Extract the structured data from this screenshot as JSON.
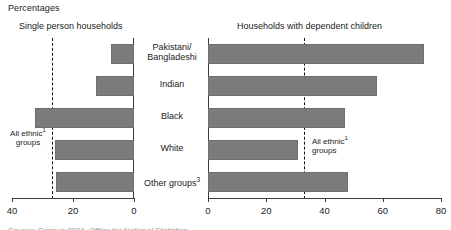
{
  "units_label": "Percentages",
  "panels": {
    "left": {
      "title": "Single person households"
    },
    "right": {
      "title": "Households with dependent children"
    }
  },
  "annotations": {
    "left_ref_line_1": "All ethnic",
    "left_ref_line_1_sup": "1",
    "left_ref_line_2": "groups",
    "right_ref_line_1": "All ethnic",
    "right_ref_line_1_sup": "1",
    "right_ref_line_2": "groups"
  },
  "footnote_strip": "Source: Census 2001, Office for National Statistics",
  "chart_data": {
    "type": "bar",
    "title": "Percentages",
    "orientation": "horizontal",
    "layout": "back-to-back paired panels",
    "categories": [
      "Pakistani/ Bangladeshi",
      "Indian",
      "Black",
      "White",
      "Other groups"
    ],
    "category_labels_display": [
      {
        "line1": "Pakistani/",
        "line2": "Bangladeshi",
        "sup": ""
      },
      {
        "line1": "Indian",
        "line2": "",
        "sup": ""
      },
      {
        "line1": "Black",
        "line2": "",
        "sup": ""
      },
      {
        "line1": "White",
        "line2": "",
        "sup": ""
      },
      {
        "line1": "Other groups",
        "line2": "",
        "sup": "3"
      }
    ],
    "series": [
      {
        "name": "Single person households",
        "panel": "left",
        "direction": "right-to-left",
        "values": [
          7.5,
          12.5,
          32.5,
          26,
          25.5
        ],
        "xlabel": "",
        "ylabel": "",
        "xlim": [
          40,
          0
        ],
        "ticks": [
          40,
          20,
          0
        ],
        "tick_labels": [
          "40",
          "20",
          "0"
        ],
        "reference_line_value": 26.5,
        "reference_line_label": "All ethnic groups"
      },
      {
        "name": "Households with dependent children",
        "panel": "right",
        "direction": "left-to-right",
        "values": [
          74,
          58,
          47,
          31,
          48
        ],
        "xlabel": "",
        "ylabel": "",
        "xlim": [
          0,
          80
        ],
        "ticks": [
          0,
          20,
          40,
          60,
          80
        ],
        "tick_labels": [
          "0",
          "20",
          "40",
          "60",
          "80"
        ],
        "reference_line_value": 33,
        "reference_line_label": "All ethnic groups"
      }
    ],
    "grid": false,
    "legend": "none",
    "bar_color": "#7b7b7b",
    "axis_color": "#3a3a3a"
  }
}
